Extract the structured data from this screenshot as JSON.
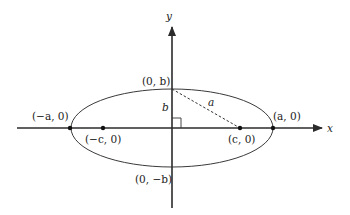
{
  "diagram": {
    "axes": {
      "x_label": "x",
      "y_label": "y"
    },
    "points": [
      {
        "id": "vertex-left",
        "label": "(−a, 0)",
        "math": {
          "x": "-a",
          "y": "0"
        }
      },
      {
        "id": "vertex-right",
        "label": "(a, 0)",
        "math": {
          "x": "a",
          "y": "0"
        }
      },
      {
        "id": "focus-left",
        "label": "(−c, 0)",
        "math": {
          "x": "-c",
          "y": "0"
        }
      },
      {
        "id": "focus-right",
        "label": "(c, 0)",
        "math": {
          "x": "c",
          "y": "0"
        }
      },
      {
        "id": "covertex-top",
        "label": "(0, b)",
        "math": {
          "x": "0",
          "y": "b"
        }
      },
      {
        "id": "covertex-bottom",
        "label": "(0, −b)",
        "math": {
          "x": "0",
          "y": "-b"
        }
      }
    ],
    "segments": [
      {
        "id": "segment-b",
        "label": "b",
        "style": "solid",
        "from": "origin",
        "to": "covertex-top"
      },
      {
        "id": "segment-a",
        "label": "a",
        "style": "dashed",
        "from": "covertex-top",
        "to": "focus-right"
      }
    ],
    "annotations": {
      "right_angle_marker": true
    },
    "colors": {
      "stroke": "#2b2b2b",
      "text": "#222222",
      "background": "#ffffff"
    }
  },
  "labels": {
    "x_axis": "x",
    "y_axis": "y",
    "vertex_left": "(−a, 0)",
    "vertex_right": "(a, 0)",
    "focus_left": "(−c, 0)",
    "focus_right": "(c, 0)",
    "covertex_top": "(0, b)",
    "covertex_bottom": "(0, −b)",
    "seg_b": "b",
    "seg_a": "a"
  }
}
